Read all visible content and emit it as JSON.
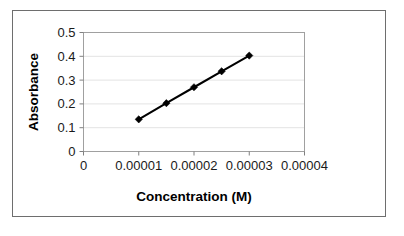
{
  "chart_data": {
    "type": "line",
    "title": "",
    "xlabel": "Concentration (M)",
    "ylabel": "Absorbance",
    "x": [
      1e-05,
      1.5e-05,
      2e-05,
      2.5e-05,
      3e-05
    ],
    "values": [
      0.135,
      0.203,
      0.27,
      0.337,
      0.403
    ],
    "series": [
      {
        "name": "Absorbance",
        "x": [
          1e-05,
          1.5e-05,
          2e-05,
          2.5e-05,
          3e-05
        ],
        "values": [
          0.135,
          0.203,
          0.27,
          0.337,
          0.403
        ]
      }
    ],
    "xlim": [
      0,
      4e-05
    ],
    "ylim": [
      0,
      0.5
    ],
    "xticks": [
      0,
      1e-05,
      2e-05,
      3e-05,
      4e-05
    ],
    "yticks": [
      0,
      0.1,
      0.2,
      0.3,
      0.4,
      0.5
    ],
    "xtick_labels": [
      "0",
      "0.00001",
      "0.00002",
      "0.00003",
      "0.00004"
    ],
    "ytick_labels": [
      "0",
      "0.1",
      "0.2",
      "0.3",
      "0.4",
      "0.5"
    ],
    "grid": "horizontal",
    "legend": "none",
    "marker": "diamond",
    "line_color": "#000000",
    "marker_color": "#000000",
    "gridline_color": "#e3e3e3",
    "plot_border_color": "#a0a0a0",
    "frame_border_color": "#6e6e6e",
    "background_color": "#ffffff"
  }
}
